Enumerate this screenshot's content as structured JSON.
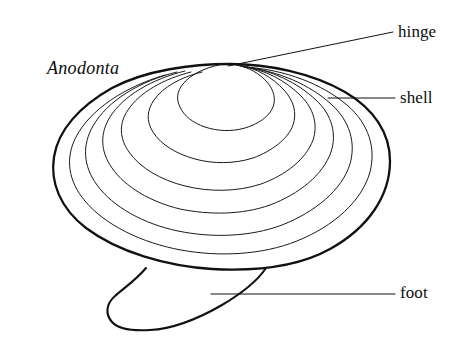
{
  "figure": {
    "kind": "scientific-line-drawing",
    "background_color": "#ffffff",
    "ink_color": "#111111",
    "outline_stroke_width": 2.2,
    "growth_ring_stroke_width": 1.0,
    "leader_stroke_width": 1.0,
    "width": 474,
    "height": 341
  },
  "genus": {
    "name": "Anodonta",
    "style": "italic"
  },
  "labels": [
    {
      "id": "hinge",
      "text": "hinge",
      "part": "hinge",
      "leader": {
        "type": "diagonal",
        "from_x": 228,
        "from_y": 66,
        "to_x": 393,
        "to_y": 32
      }
    },
    {
      "id": "shell",
      "text": "shell",
      "part": "shell",
      "leader": {
        "type": "horizontal",
        "from_x": 328,
        "from_y": 98,
        "to_x": 395,
        "to_y": 98
      }
    },
    {
      "id": "foot",
      "text": "foot",
      "part": "foot",
      "leader": {
        "type": "horizontal",
        "from_x": 211,
        "from_y": 294,
        "to_x": 395,
        "to_y": 294
      }
    }
  ],
  "anatomy": {
    "shell": {
      "label": "shell",
      "bounds": {
        "left": 52,
        "top": 62,
        "right": 390,
        "bottom": 270
      },
      "growth_ring_count": 6
    },
    "hinge": {
      "label": "hinge",
      "apex": {
        "x": 230,
        "y": 64
      }
    },
    "foot": {
      "label": "foot",
      "bounds": {
        "left": 107,
        "top": 267,
        "right": 268,
        "bottom": 331
      }
    }
  }
}
